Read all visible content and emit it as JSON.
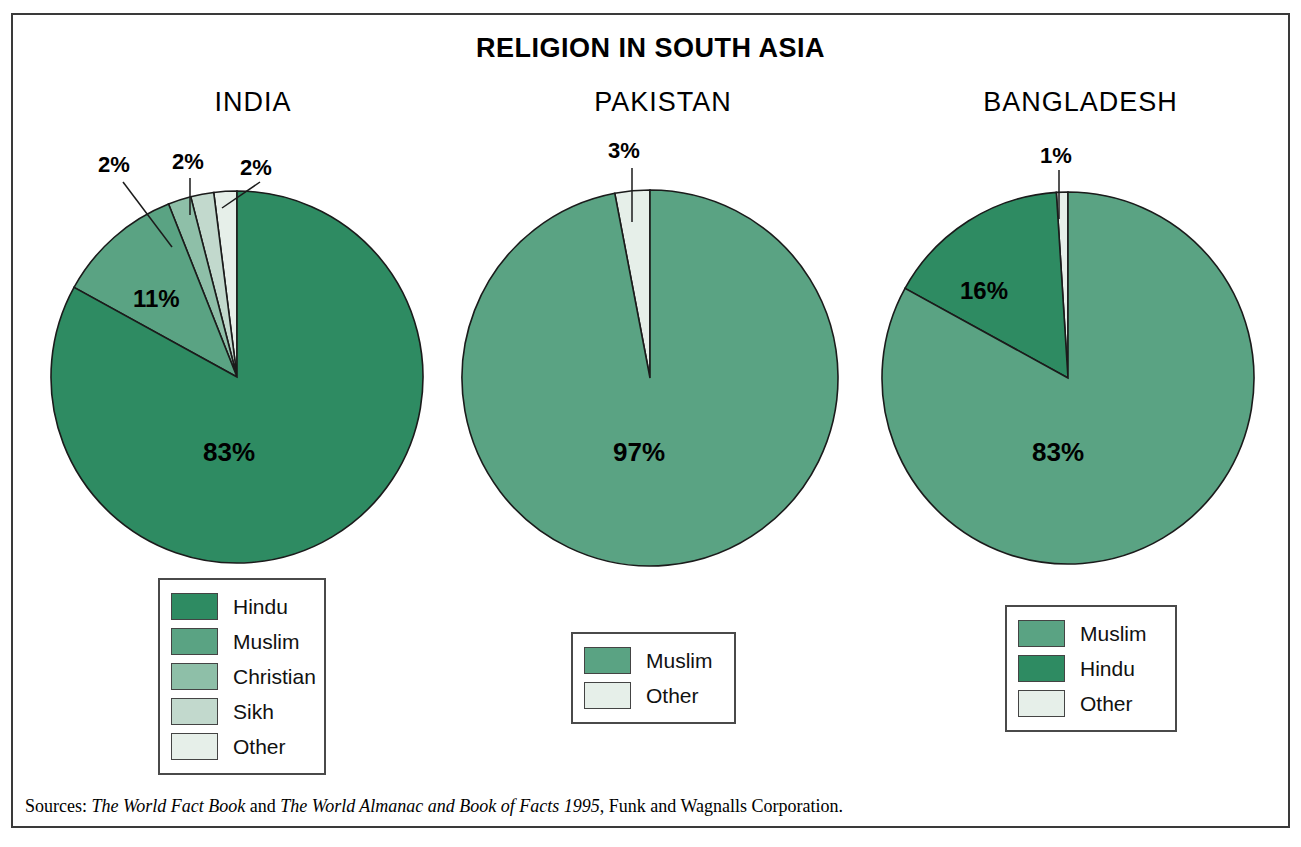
{
  "title": "RELIGION IN SOUTH ASIA",
  "sources": {
    "prefix": "Sources: ",
    "work1": "The World Fact Book",
    "conjunction": " and ",
    "work2": "The World Almanac and Book of Facts 1995",
    "suffix": ", Funk and Wagnalls Corporation."
  },
  "colors": {
    "shade1_dark": "#2e8b62",
    "shade2": "#5aa383",
    "shade3": "#8ebfa8",
    "shade4": "#c2d9cd",
    "shade5_light": "#e6efe9",
    "outline": "#1b1b1b",
    "border": "#3a3a3a"
  },
  "chart_data": [
    {
      "type": "pie",
      "title": "INDIA",
      "categories": [
        "Hindu",
        "Muslim",
        "Christian",
        "Sikh",
        "Other"
      ],
      "values": [
        83,
        11,
        2,
        2,
        2
      ],
      "labels": [
        "83%",
        "11%",
        "2%",
        "2%",
        "2%"
      ],
      "colors": [
        "#2e8b62",
        "#5aa383",
        "#8ebfa8",
        "#c2d9cd",
        "#e6efe9"
      ],
      "legend_position": "below-left",
      "units": "percent"
    },
    {
      "type": "pie",
      "title": "PAKISTAN",
      "categories": [
        "Muslim",
        "Other"
      ],
      "values": [
        97,
        3
      ],
      "labels": [
        "97%",
        "3%"
      ],
      "colors": [
        "#5aa383",
        "#e6efe9"
      ],
      "legend_position": "below-center",
      "units": "percent"
    },
    {
      "type": "pie",
      "title": "BANGLADESH",
      "categories": [
        "Muslim",
        "Hindu",
        "Other"
      ],
      "values": [
        83,
        16,
        1
      ],
      "labels": [
        "83%",
        "16%",
        "1%"
      ],
      "colors": [
        "#5aa383",
        "#2e8b62",
        "#e6efe9"
      ],
      "legend_position": "below-right",
      "units": "percent"
    }
  ],
  "charts": [
    {
      "name": "india",
      "title": "INDIA",
      "legend": [
        {
          "label": "Hindu",
          "color": "#2e8b62"
        },
        {
          "label": "Muslim",
          "color": "#5aa383"
        },
        {
          "label": "Christian",
          "color": "#8ebfa8"
        },
        {
          "label": "Sikh",
          "color": "#c2d9cd"
        },
        {
          "label": "Other",
          "color": "#e6efe9"
        }
      ],
      "callouts": [
        {
          "text": "2%",
          "series": "Christian"
        },
        {
          "text": "2%",
          "series": "Sikh"
        },
        {
          "text": "2%",
          "series": "Other"
        }
      ],
      "inner_labels": [
        {
          "text": "11%",
          "series": "Muslim"
        },
        {
          "text": "83%",
          "series": "Hindu"
        }
      ]
    },
    {
      "name": "pakistan",
      "title": "PAKISTAN",
      "legend": [
        {
          "label": "Muslim",
          "color": "#5aa383"
        },
        {
          "label": "Other",
          "color": "#e6efe9"
        }
      ],
      "callouts": [
        {
          "text": "3%",
          "series": "Other"
        }
      ],
      "inner_labels": [
        {
          "text": "97%",
          "series": "Muslim"
        }
      ]
    },
    {
      "name": "bangladesh",
      "title": "BANGLADESH",
      "legend": [
        {
          "label": "Muslim",
          "color": "#5aa383"
        },
        {
          "label": "Hindu",
          "color": "#2e8b62"
        },
        {
          "label": "Other",
          "color": "#e6efe9"
        }
      ],
      "callouts": [
        {
          "text": "1%",
          "series": "Other"
        }
      ],
      "inner_labels": [
        {
          "text": "16%",
          "series": "Hindu"
        },
        {
          "text": "83%",
          "series": "Muslim"
        }
      ]
    }
  ]
}
